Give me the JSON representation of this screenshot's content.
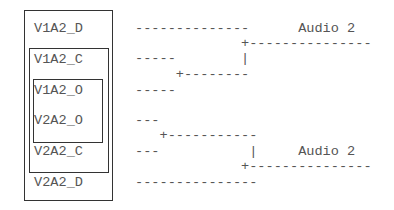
{
  "boxes": {
    "outer": {
      "labels": [
        "V1A2_D",
        "V2A2_D"
      ]
    },
    "middle": {
      "labels": [
        "V1A2_C",
        "V2A2_C"
      ]
    },
    "inner": {
      "labels": [
        "V1A2_O",
        "V2A2_O"
      ]
    }
  },
  "node_labels": [
    "V1A2_D",
    "V1A2_C",
    "V1A2_O",
    "V2A2_O",
    "V2A2_C",
    "V2A2_D"
  ],
  "lines": [
    "--------------      Audio 2",
    "             +---------------",
    "-----        |",
    "     +--------",
    "-----",
    "---",
    "   +-----------",
    "---           |     Audio 2",
    "             +---------------",
    "---------------"
  ],
  "outputs": [
    "Audio 2",
    "Audio 2"
  ]
}
